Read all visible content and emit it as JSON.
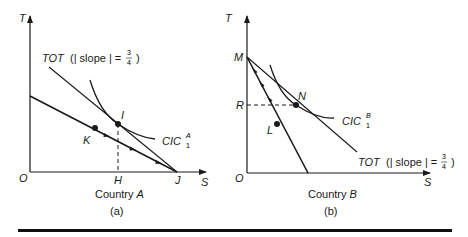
{
  "figure": {
    "panels": [
      {
        "id": "a",
        "caption": "(a)",
        "country_label_prefix": "Country ",
        "country_label_var": "A",
        "axes": {
          "x_label": "S",
          "y_label": "T",
          "origin_label": "O"
        },
        "points": {
          "I": "I",
          "K": "K",
          "H": "H",
          "J": "J"
        },
        "tot_label": {
          "prefix": "TOT",
          "text": "(| slope | =",
          "num": "3",
          "den": "4",
          "close": ")"
        },
        "cic_label": {
          "base": "CIC",
          "sup": "A",
          "sub": "1"
        }
      },
      {
        "id": "b",
        "caption": "(b)",
        "country_label_prefix": "Country ",
        "country_label_var": "B",
        "axes": {
          "x_label": "S",
          "y_label": "T",
          "origin_label": "O"
        },
        "points": {
          "M": "M",
          "R": "R",
          "N": "N",
          "L": "L"
        },
        "tot_label": {
          "prefix": "TOT",
          "text": "(| slope | =",
          "num": "3",
          "den": "4",
          "close": ")"
        },
        "cic_label": {
          "base": "CIC",
          "sup": "B",
          "sub": "1"
        }
      }
    ]
  }
}
